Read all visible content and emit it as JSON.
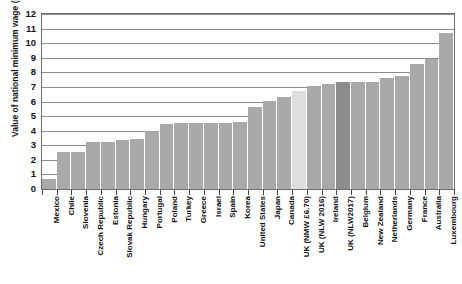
{
  "chart_data": {
    "type": "bar",
    "title": "",
    "subtitle": "",
    "xlabel": "",
    "ylabel": "Value of national minimum wage (£)",
    "ylim": [
      0,
      12
    ],
    "ytick_labels": [
      "0",
      "1",
      "2",
      "3",
      "4",
      "5",
      "6",
      "7",
      "8",
      "9",
      "10",
      "11",
      "12"
    ],
    "ytick_values": [
      0,
      1,
      2,
      3,
      4,
      5,
      6,
      7,
      8,
      9,
      10,
      11,
      12
    ],
    "grid": true,
    "legend": "none",
    "categories": [
      "Mexico",
      "Chile",
      "Slovenia",
      "Czech Republic",
      "Estonia",
      "Slovak Republic",
      "Hungary",
      "Portugal",
      "Poland",
      "Turkey",
      "Greece",
      "Israel",
      "Spain",
      "Korea",
      "United States",
      "Japan",
      "Canada",
      "UK (NMW £6.70)",
      "UK (NLW 2016)",
      "Ireland",
      "UK (NLW2017)",
      "Belgium",
      "New Zealand",
      "Netherlands",
      "Germany",
      "France",
      "Australia",
      "Luxembourg"
    ],
    "values": [
      0.7,
      2.55,
      2.55,
      3.2,
      3.2,
      3.35,
      3.45,
      3.95,
      4.45,
      4.5,
      4.5,
      4.5,
      4.55,
      4.6,
      5.6,
      6.0,
      6.3,
      6.7,
      7.05,
      7.2,
      7.35,
      7.35,
      7.35,
      7.6,
      7.75,
      8.6,
      8.9,
      10.7
    ],
    "bar_styles": [
      "normal",
      "normal",
      "normal",
      "normal",
      "normal",
      "normal",
      "normal",
      "normal",
      "normal",
      "normal",
      "normal",
      "normal",
      "normal",
      "normal",
      "normal",
      "normal",
      "normal",
      "highlight-light",
      "normal",
      "normal",
      "highlight-dark",
      "normal",
      "normal",
      "normal",
      "normal",
      "normal",
      "normal",
      "normal"
    ],
    "colors": {
      "bar": "#a9a9a9",
      "highlight_light": "#dedede",
      "highlight_dark": "#8c8c8c",
      "grid": "#8c8c8c",
      "axis": "#6f6f6f",
      "text": "#111111",
      "background": "#ffffff"
    }
  }
}
